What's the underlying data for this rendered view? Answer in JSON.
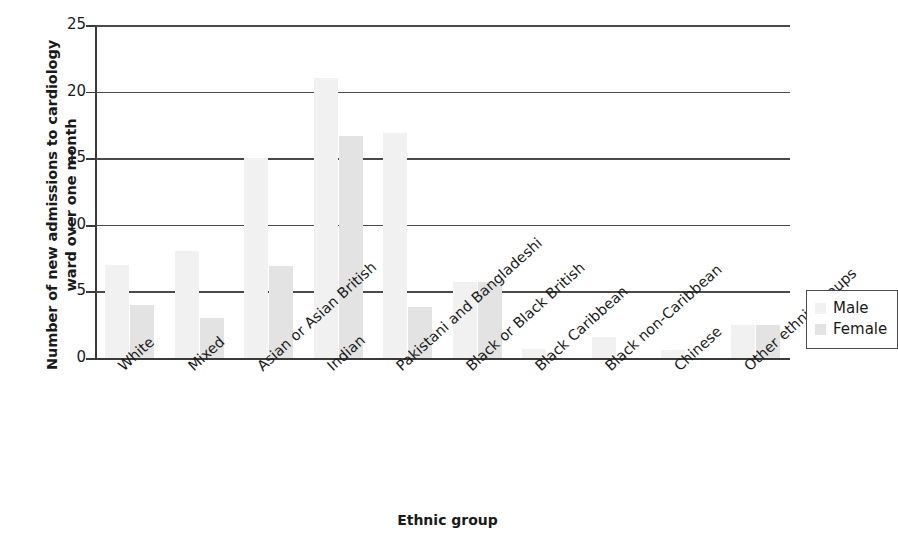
{
  "chart_data": {
    "type": "bar",
    "title": "",
    "xlabel": "Ethnic group",
    "ylabel": "Number of new admissions to cardiology\nward over one month",
    "ylim": [
      0,
      25
    ],
    "yticks": [
      0,
      5,
      10,
      15,
      20,
      25
    ],
    "grid": true,
    "legend_position": "right",
    "categories": [
      "White",
      "Mixed",
      "Asian or Asian British",
      "Indian",
      "Pakistani and Bangladeshi",
      "Black or Black British",
      "Black Caribbean",
      "Black non-Caribbean",
      "Chinese",
      "Other ethnic groups"
    ],
    "series": [
      {
        "name": "Male",
        "color": "#f1f1f1",
        "values": [
          7.0,
          8.0,
          15.0,
          21.0,
          16.9,
          5.7,
          0.7,
          1.6,
          0.6,
          2.5
        ]
      },
      {
        "name": "Female",
        "color": "#e3e3e3",
        "values": [
          4.0,
          3.0,
          6.9,
          16.7,
          3.8,
          5.7,
          0.0,
          0.0,
          0.0,
          2.5
        ]
      }
    ]
  },
  "legend": {
    "items": [
      {
        "label": "Male",
        "color": "#f1f1f1"
      },
      {
        "label": "Female",
        "color": "#e3e3e3"
      }
    ]
  },
  "axes": {
    "y_title": "Number of new admissions to cardiology\nward over one month",
    "x_title": "Ethnic group",
    "y_tick_labels": [
      "0",
      "5",
      "10",
      "15",
      "20",
      "25"
    ]
  }
}
